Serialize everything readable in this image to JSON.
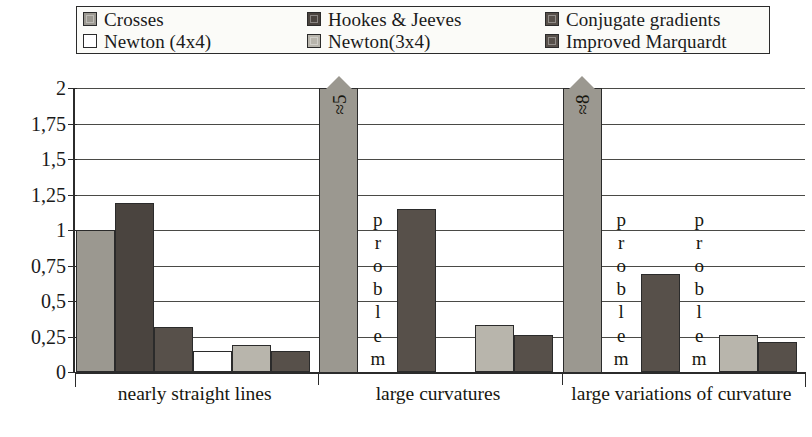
{
  "chart_data": {
    "type": "bar",
    "title": "",
    "xlabel": "",
    "ylabel": "",
    "ylim": [
      0,
      2
    ],
    "grid": true,
    "legend_position": "top",
    "decimal_separator": ",",
    "categories": [
      "nearly straight lines",
      "large curvatures",
      "large variations of curvature"
    ],
    "ytick_labels": [
      "0",
      "0,25",
      "0,5",
      "0,75",
      "1",
      "1,25",
      "1,5",
      "1,75",
      "2"
    ],
    "ytick_values": [
      0,
      0.25,
      0.5,
      0.75,
      1,
      1.25,
      1.5,
      1.75,
      2
    ],
    "series": [
      {
        "name": "Crosses",
        "color": "#9b9890",
        "values": [
          1.0,
          2.0,
          2.0
        ],
        "annotations": [
          "",
          "≈5",
          "≈8"
        ],
        "overflow": [
          false,
          true,
          true
        ]
      },
      {
        "name": "Hookes & Jeeves",
        "color": "#4a443f",
        "values": [
          1.19,
          null,
          null
        ],
        "annotations": [
          "",
          "problem",
          "problem"
        ],
        "overflow": [
          false,
          false,
          false
        ]
      },
      {
        "name": "Conjugate gradients",
        "color": "#57504a",
        "values": [
          0.32,
          1.15,
          0.69
        ],
        "annotations": [
          "",
          "",
          ""
        ],
        "overflow": [
          false,
          false,
          false
        ]
      },
      {
        "name": "Newton (4x4)",
        "color": "#ffffff",
        "values": [
          0.15,
          0.0,
          null
        ],
        "annotations": [
          "",
          "",
          "problem"
        ],
        "overflow": [
          false,
          false,
          false
        ]
      },
      {
        "name": "Newton(3x4)",
        "color": "#b8b5ac",
        "values": [
          0.19,
          0.33,
          0.26
        ],
        "annotations": [
          "",
          "",
          ""
        ],
        "overflow": [
          false,
          false,
          false
        ]
      },
      {
        "name": "Improved Marquardt",
        "color": "#57504a",
        "values": [
          0.15,
          0.26,
          0.21
        ],
        "annotations": [
          "",
          "",
          ""
        ],
        "overflow": [
          false,
          false,
          false
        ]
      }
    ],
    "problem_label": "problem"
  },
  "legend": {
    "items": [
      {
        "label": "Crosses",
        "color": "#9b9890"
      },
      {
        "label": "Hookes & Jeeves",
        "color": "#4a443f"
      },
      {
        "label": "Conjugate gradients",
        "color": "#57504a"
      },
      {
        "label": "Newton (4x4)",
        "color": "#ffffff"
      },
      {
        "label": "Newton(3x4)",
        "color": "#b8b5ac"
      },
      {
        "label": "Improved Marquardt",
        "color": "#57504a"
      }
    ]
  },
  "axis": {
    "y_labels": [
      "2",
      "1,75",
      "1,5",
      "1,25",
      "1",
      "0,75",
      "0,5",
      "0,25",
      "0"
    ],
    "x_labels": [
      "nearly straight lines",
      "large curvatures",
      "large variations of curvature"
    ]
  }
}
